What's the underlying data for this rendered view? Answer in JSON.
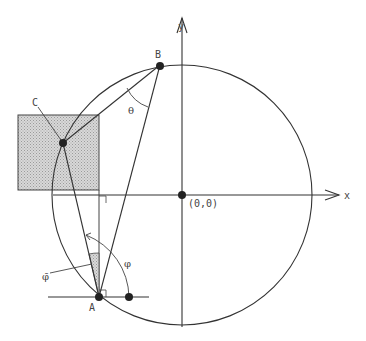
{
  "diagram": {
    "axes": {
      "x_label": "x",
      "y_label": "y",
      "origin_label": "(0,0)"
    },
    "points": {
      "A": "A",
      "B": "B",
      "C": "C"
    },
    "angles": {
      "theta": "θ",
      "phi": "φ",
      "phi_bar": "φ̄"
    },
    "colors": {
      "stroke": "#333333",
      "fill_shaded": "#cfcfcf",
      "background": "#ffffff"
    }
  }
}
